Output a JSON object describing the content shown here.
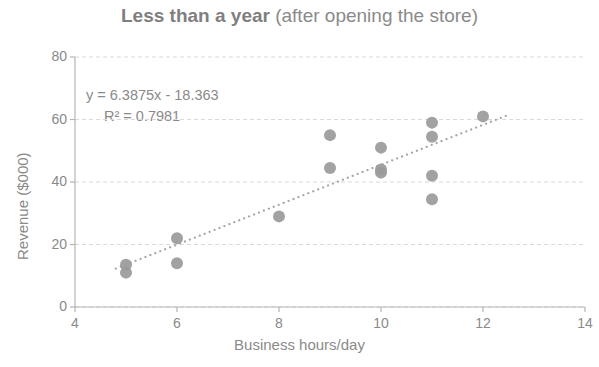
{
  "chart_data": {
    "type": "scatter",
    "title": "Less than a year (after opening the store)",
    "title_bold_part": "Less than a year",
    "title_normal_part": " (after opening the store)",
    "xlabel": "Business hours/day",
    "ylabel": "Revenue ($000)",
    "xlim": [
      4,
      14
    ],
    "ylim": [
      0,
      80
    ],
    "xticks": [
      "4",
      "6",
      "8",
      "10",
      "12",
      "14"
    ],
    "yticks": [
      "0",
      "20",
      "40",
      "60",
      "80"
    ],
    "xtick_values": [
      4,
      6,
      8,
      10,
      12,
      14
    ],
    "ytick_values": [
      0,
      20,
      40,
      60,
      80
    ],
    "grid": "horizontal",
    "legend": "none",
    "marker_color": "#9a9a9a",
    "axis_color": "#b5b5b5",
    "grid_color": "#d9d9d9",
    "text_color": "#8a8a8a",
    "points": [
      {
        "x": 5,
        "y": 13.5
      },
      {
        "x": 5,
        "y": 11
      },
      {
        "x": 6,
        "y": 22
      },
      {
        "x": 6,
        "y": 14
      },
      {
        "x": 8,
        "y": 29
      },
      {
        "x": 9,
        "y": 55
      },
      {
        "x": 9,
        "y": 44.5
      },
      {
        "x": 10,
        "y": 51
      },
      {
        "x": 10,
        "y": 44
      },
      {
        "x": 10,
        "y": 43
      },
      {
        "x": 11,
        "y": 59
      },
      {
        "x": 11,
        "y": 54.5
      },
      {
        "x": 11,
        "y": 42
      },
      {
        "x": 11,
        "y": 34.5
      },
      {
        "x": 12,
        "y": 61
      }
    ],
    "x": [
      5,
      5,
      6,
      6,
      8,
      9,
      9,
      10,
      10,
      10,
      11,
      11,
      11,
      11,
      12
    ],
    "values": [
      13.5,
      11,
      22,
      14,
      29,
      55,
      44.5,
      51,
      44,
      43,
      59,
      54.5,
      42,
      34.5,
      61
    ],
    "trendline": {
      "style": "dotted",
      "equation_label": "y = 6.3875x - 18.363",
      "r2_label": "R² = 0.7981",
      "slope": 6.3875,
      "intercept": -18.363,
      "r_squared": 0.7981,
      "x_start": 4.8,
      "x_end": 12.45
    },
    "annotation_lines": [
      "y = 6.3875x - 18.363",
      "R² = 0.7981"
    ]
  }
}
